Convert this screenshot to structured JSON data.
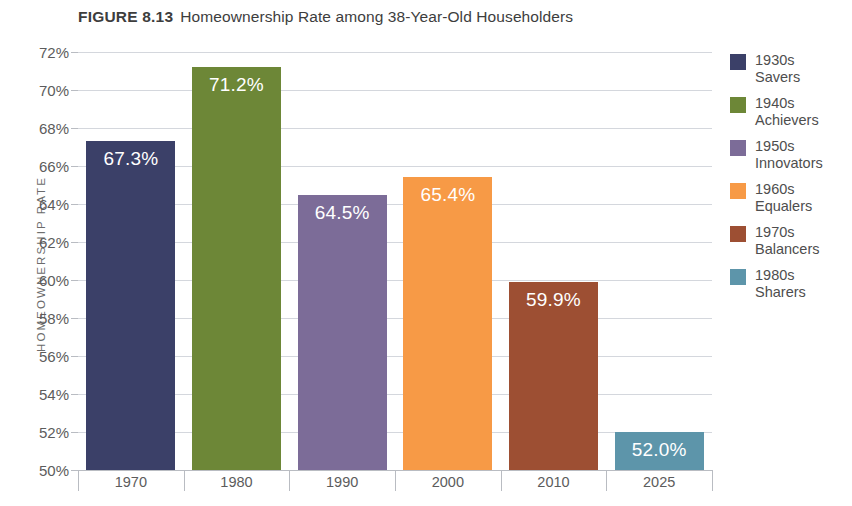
{
  "title": {
    "figure_number": "FIGURE 8.13",
    "caption": "Homeownership Rate among 38-Year-Old Householders"
  },
  "axes": {
    "y_axis_title": "HOMEOWNERSHIP RATE"
  },
  "legend": {
    "position": "right",
    "items": [
      {
        "decade": "1930s",
        "name": "Savers",
        "color": "#3b4068"
      },
      {
        "decade": "1940s",
        "name": "Achievers",
        "color": "#6d8737"
      },
      {
        "decade": "1950s",
        "name": "Innovators",
        "color": "#7c6c98"
      },
      {
        "decade": "1960s",
        "name": "Equalers",
        "color": "#f79a46"
      },
      {
        "decade": "1970s",
        "name": "Balancers",
        "color": "#9d4f33"
      },
      {
        "decade": "1980s",
        "name": "Sharers",
        "color": "#5d95aa"
      }
    ]
  },
  "chart_data": {
    "type": "bar",
    "title": "Homeownership Rate among 38-Year-Old Householders",
    "xlabel": "",
    "ylabel": "HOMEOWNERSHIP RATE",
    "categories": [
      "1970",
      "1980",
      "1990",
      "2000",
      "2010",
      "2025"
    ],
    "values": [
      67.3,
      71.2,
      64.5,
      65.4,
      59.9,
      52.0
    ],
    "value_labels": [
      "67.3%",
      "71.2%",
      "64.5%",
      "65.4%",
      "59.9%",
      "52.0%"
    ],
    "series_names": [
      "1930s Savers",
      "1940s Achievers",
      "1950s Innovators",
      "1960s Equalers",
      "1970s Balancers",
      "1980s Sharers"
    ],
    "bar_colors": [
      "#3b4068",
      "#6d8737",
      "#7c6c98",
      "#f79a46",
      "#9d4f33",
      "#5d95aa"
    ],
    "ylim": [
      50,
      72
    ],
    "ytick_values": [
      50,
      52,
      54,
      56,
      58,
      60,
      62,
      64,
      66,
      68,
      70,
      72
    ],
    "ytick_labels": [
      "50%",
      "52%",
      "54%",
      "56%",
      "58%",
      "60%",
      "62%",
      "64%",
      "66%",
      "68%",
      "70%",
      "72%"
    ],
    "grid": true,
    "legend_position": "right",
    "value_label_color": "#ffffff"
  }
}
